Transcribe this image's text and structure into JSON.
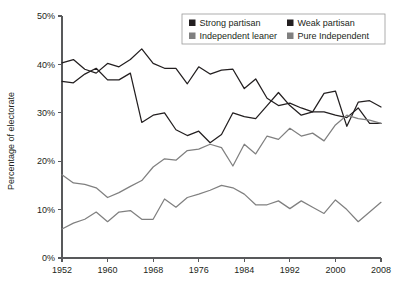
{
  "chart_data": {
    "type": "line",
    "title": "",
    "xlabel": "",
    "ylabel": "Percentage of electorate",
    "xlim": [
      1952,
      2008
    ],
    "ylim": [
      0,
      50
    ],
    "grid": false,
    "legend_position": "top-right",
    "x_tick_labels": [
      "1952",
      "1960",
      "1968",
      "1976",
      "1984",
      "1992",
      "2000",
      "2008"
    ],
    "x_ticks": [
      1952,
      1960,
      1968,
      1976,
      1984,
      1992,
      2000,
      2008
    ],
    "y_tick_labels": [
      "0%",
      "10%",
      "20%",
      "30%",
      "40%",
      "50%"
    ],
    "y_ticks": [
      0,
      10,
      20,
      30,
      40,
      50
    ],
    "x": [
      1952,
      1954,
      1956,
      1958,
      1960,
      1962,
      1964,
      1966,
      1968,
      1970,
      1972,
      1974,
      1976,
      1978,
      1980,
      1982,
      1984,
      1986,
      1988,
      1990,
      1992,
      1994,
      1996,
      1998,
      2000,
      2002,
      2004,
      2006,
      2008
    ],
    "series": [
      {
        "name": "Strong partisan",
        "color": "#231f20",
        "values": [
          36.5,
          36.2,
          38.0,
          39.2,
          36.8,
          36.8,
          38.2,
          28.0,
          29.5,
          30.0,
          26.5,
          25.3,
          26.2,
          23.8,
          25.5,
          30.0,
          29.2,
          28.8,
          31.5,
          34.2,
          31.5,
          29.5,
          30.2,
          34.0,
          34.5,
          27.2,
          32.2,
          32.5,
          31.2
        ]
      },
      {
        "name": "Weak partisan",
        "color": "#231f20",
        "values": [
          40.3,
          41.0,
          39.0,
          38.2,
          40.2,
          39.5,
          41.0,
          43.2,
          40.2,
          39.2,
          39.2,
          36.0,
          39.5,
          38.0,
          38.8,
          39.0,
          35.0,
          37.0,
          33.0,
          31.5,
          32.0,
          31.0,
          30.2,
          30.2,
          29.5,
          29.0,
          31.0,
          27.8,
          27.8
        ]
      },
      {
        "name": "Independent leaner",
        "color": "#808080",
        "values": [
          17.2,
          15.5,
          15.2,
          14.5,
          12.5,
          13.5,
          14.8,
          16.0,
          18.8,
          20.5,
          20.2,
          22.2,
          22.5,
          23.5,
          22.8,
          19.0,
          23.5,
          21.5,
          25.2,
          24.5,
          26.8,
          25.2,
          25.8,
          24.2,
          27.5,
          29.5,
          28.8,
          28.5,
          27.8
        ]
      },
      {
        "name": "Pure Independent",
        "color": "#808080",
        "values": [
          6.0,
          7.2,
          8.0,
          9.5,
          7.5,
          9.5,
          9.8,
          8.0,
          8.0,
          12.2,
          10.5,
          12.5,
          13.2,
          14.0,
          15.0,
          14.5,
          13.2,
          11.0,
          11.0,
          11.8,
          10.2,
          11.8,
          10.5,
          9.2,
          12.0,
          10.0,
          7.5,
          9.5,
          11.5
        ]
      }
    ]
  },
  "legend": {
    "items": [
      {
        "label": "Strong partisan",
        "swatch": "#231f20"
      },
      {
        "label": "Weak partisan",
        "swatch": "#231f20"
      },
      {
        "label": "Independent leaner",
        "swatch": "#808080"
      },
      {
        "label": "Pure Independent",
        "swatch": "#808080"
      }
    ]
  },
  "axes": {
    "y_title": "Percentage of electorate"
  }
}
